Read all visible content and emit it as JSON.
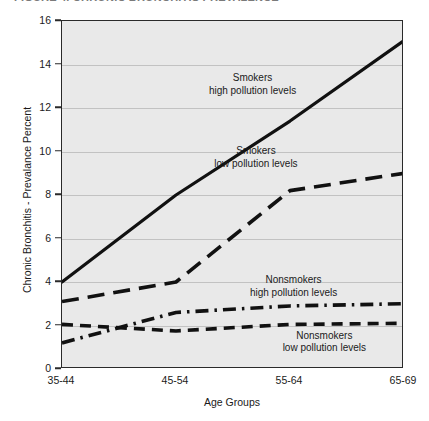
{
  "figure": {
    "title_clipped": "FIGURE 4.  CHRONIC BRONCHITIS PREVALENCE"
  },
  "chart_data": {
    "type": "line",
    "title": "",
    "xlabel": "Age Groups",
    "ylabel": "Chronic Bronchitis - Prevalance Percent",
    "categories": [
      "35-44",
      "45-54",
      "55-64",
      "65-69"
    ],
    "ylim": [
      0,
      16
    ],
    "yticks": [
      0,
      2,
      4,
      6,
      8,
      10,
      12,
      14,
      16
    ],
    "grid": true,
    "legend_position": "inline-annotations",
    "plot_background": "#e9e9e9",
    "series": [
      {
        "name": "Smokers high pollution levels",
        "label_line1": "Smokers",
        "label_line2": "high pollution levels",
        "style": "solid",
        "color": "#111111",
        "values": [
          4.0,
          8.0,
          11.4,
          15.1
        ],
        "label_x_pct": 56,
        "label_y_pct": 15
      },
      {
        "name": "Smokers low pollution levels",
        "label_line1": "Smokers",
        "label_line2": "low pollution levels",
        "style": "long-dash",
        "color": "#111111",
        "values": [
          3.1,
          4.0,
          8.2,
          9.0
        ],
        "label_x_pct": 57,
        "label_y_pct": 36
      },
      {
        "name": "Nonsmokers high pollution levels",
        "label_line1": "Nonsmokers",
        "label_line2": "high pollution levels",
        "style": "dash-dot",
        "color": "#111111",
        "values": [
          1.2,
          2.6,
          2.9,
          3.0
        ],
        "label_x_pct": 68,
        "label_y_pct": 73
      },
      {
        "name": "Nonsmokers low pollution levels",
        "label_line1": "Nonsmokers",
        "label_line2": "low pollution levels",
        "style": "short-dash",
        "color": "#111111",
        "values": [
          2.05,
          1.75,
          2.05,
          2.1
        ],
        "label_x_pct": 77,
        "label_y_pct": 89
      }
    ]
  }
}
